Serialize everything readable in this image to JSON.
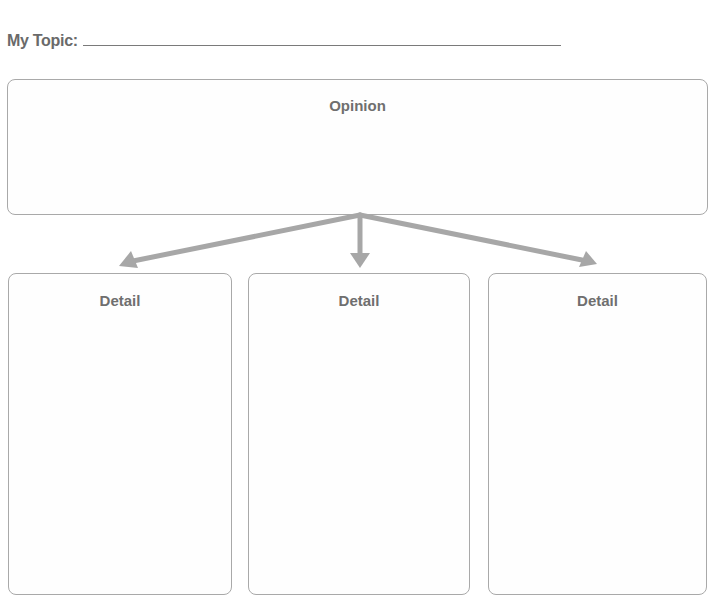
{
  "header": {
    "topic_label": "My Topic:",
    "topic_value": ""
  },
  "organizer": {
    "opinion_box": {
      "title": "Opinion",
      "content": ""
    },
    "detail_boxes": [
      {
        "title": "Detail",
        "content": ""
      },
      {
        "title": "Detail",
        "content": ""
      },
      {
        "title": "Detail",
        "content": ""
      }
    ],
    "colors": {
      "arrow": "#a7a7a7",
      "box_border": "#a9a9a9",
      "text": "#6f6f6f"
    }
  }
}
